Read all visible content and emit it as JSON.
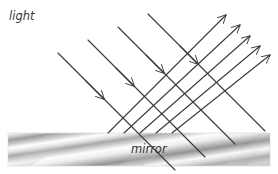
{
  "figure": {
    "width": 278,
    "height": 174,
    "background": "#ffffff"
  },
  "labels": {
    "light": "light",
    "mirror": "mirror"
  },
  "colors": {
    "ray_stroke": "#3a3a3a",
    "background": "#ffffff",
    "mirror_dark": "#8f8f8f",
    "mirror_mid": "#b8b8b8",
    "mirror_light": "#ffffff",
    "label_text": "#2f2f2f"
  },
  "mirror": {
    "x": 8,
    "y": 133,
    "width": 262,
    "height": 33,
    "streak_angle_deg": -28,
    "streak_count": 3
  },
  "rays": {
    "stroke_width": 1.1,
    "incident": {
      "count": 4,
      "direction": "down-right",
      "angle_deg": 45,
      "arrow_position": "mid",
      "segments": [
        {
          "x1": 148,
          "y1": 14,
          "x2": 265,
          "y2": 131,
          "arrow_x": 196,
          "arrow_y": 62
        },
        {
          "x1": 118,
          "y1": 27,
          "x2": 235,
          "y2": 144,
          "arrow_x": 160,
          "arrow_y": 69
        },
        {
          "x1": 88,
          "y1": 40,
          "x2": 205,
          "y2": 157,
          "arrow_x": 130,
          "arrow_y": 82
        },
        {
          "x1": 58,
          "y1": 53,
          "x2": 175,
          "y2": 170,
          "arrow_x": 100,
          "arrow_y": 95
        }
      ]
    },
    "reflected": {
      "count": 5,
      "direction": "up-right",
      "angle_deg": 45,
      "arrow_position": "tip",
      "segments": [
        {
          "x1": 108,
          "y1": 133,
          "x2": 226,
          "y2": 15
        },
        {
          "x1": 124,
          "y1": 133,
          "x2": 240,
          "y2": 25
        },
        {
          "x1": 140,
          "y1": 133,
          "x2": 250,
          "y2": 36
        },
        {
          "x1": 156,
          "y1": 133,
          "x2": 260,
          "y2": 46
        },
        {
          "x1": 172,
          "y1": 133,
          "x2": 270,
          "y2": 55
        }
      ]
    }
  }
}
